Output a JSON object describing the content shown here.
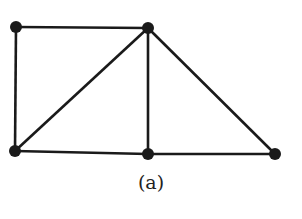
{
  "caption": "(a)",
  "graph": {
    "nodes": [
      {
        "id": "A",
        "x": 16,
        "y": 27
      },
      {
        "id": "B",
        "x": 148,
        "y": 28
      },
      {
        "id": "C",
        "x": 15,
        "y": 151
      },
      {
        "id": "D",
        "x": 148,
        "y": 154
      },
      {
        "id": "E",
        "x": 275,
        "y": 154
      }
    ],
    "edges": [
      [
        "A",
        "B"
      ],
      [
        "A",
        "C"
      ],
      [
        "B",
        "C"
      ],
      [
        "B",
        "D"
      ],
      [
        "B",
        "E"
      ],
      [
        "C",
        "D"
      ],
      [
        "D",
        "E"
      ]
    ],
    "colors": {
      "stroke": "#1a1a1a",
      "node": "#1a1a1a",
      "background": "#ffffff"
    }
  }
}
